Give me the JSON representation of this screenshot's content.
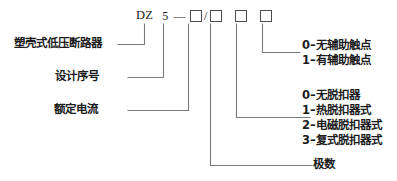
{
  "diagram": {
    "line_color": "#707070",
    "text_color": "#1b1b1b",
    "code_row": {
      "prefix": "DZ",
      "series": "5",
      "dash": "—",
      "slash": "/",
      "boxes": [
        "",
        "",
        "",
        ""
      ]
    },
    "left_labels": [
      {
        "id": "molded-case",
        "text": "塑壳式低压断路器"
      },
      {
        "id": "design-no",
        "text": "设计序号"
      },
      {
        "id": "rated-current",
        "text": "额定电流"
      }
    ],
    "aux_contact_group": {
      "options": [
        "0–无辅助触点",
        "1–有辅助触点"
      ]
    },
    "release_group": {
      "options": [
        "0–无脱扣器",
        "1–热脱扣器式",
        "2–电磁脱扣器式",
        "3–复式脱扣器式"
      ]
    },
    "poles_label": {
      "text": "极数"
    }
  }
}
